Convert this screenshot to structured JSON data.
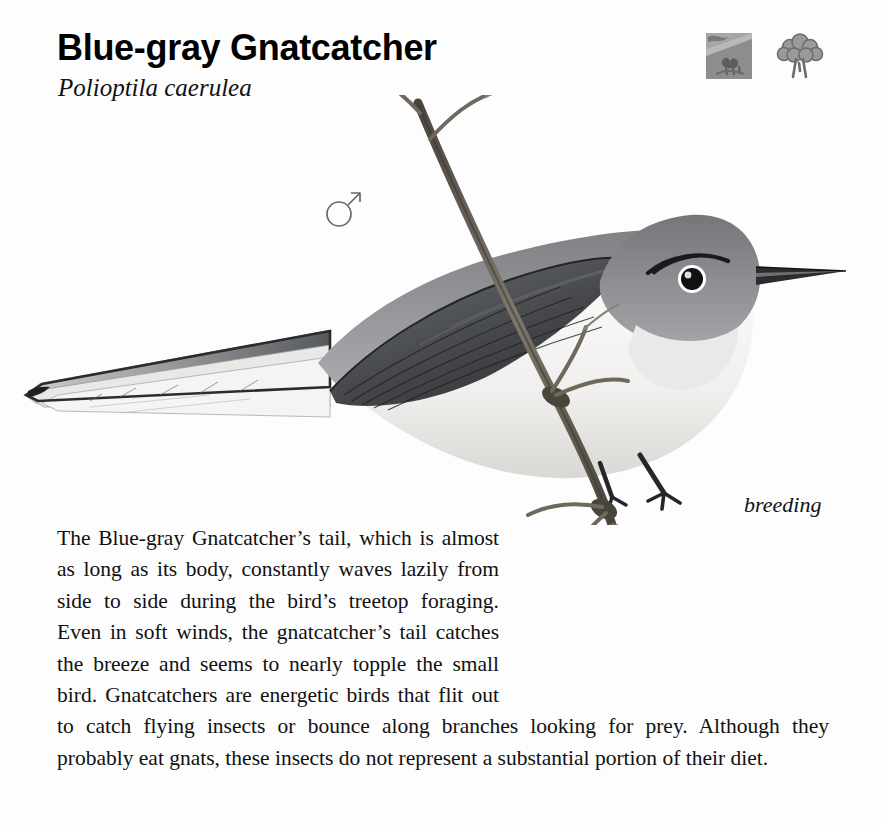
{
  "page": {
    "background": "#fdfdfd",
    "ink": "#111111"
  },
  "header": {
    "common_name": "Blue-gray Gnatcatcher",
    "scientific_name": "Polioptila caerulea"
  },
  "habitat_icons": [
    {
      "name": "hillside-scrub-habitat-icon",
      "label": "hillside scrub habitat",
      "color": "#8f8f8f"
    },
    {
      "name": "deciduous-tree-habitat-icon",
      "label": "deciduous woodland habitat",
      "color": "#909090"
    }
  ],
  "illustration": {
    "alt": "Blue-gray Gnatcatcher perched on a thin branch, long white-edged tail trailing left",
    "sex_symbol": "♂",
    "sex_label": "male",
    "plumage_caption": "breeding",
    "palette": {
      "crown": "#8b8d90",
      "back": "#9a9c9f",
      "wing": "#4a4c50",
      "underparts": "#f2f2f0",
      "tail_dark": "#3f4145",
      "branch": "#6f6a60",
      "eye": "#141414",
      "eyering": "#ffffff"
    }
  },
  "description": {
    "paragraph": "The Blue-gray Gnatcatcher’s tail, which is almost as long as its body, constantly waves lazily from side to side during the bird’s treetop foraging. Even in soft winds, the gnatcatcher’s tail catches the breeze and seems to nearly topple the small bird. Gnatcatchers are energetic birds that flit out to catch flying insects or bounce along branches looking for prey. Although they probably eat gnats, these insects do not represent a substantial portion of their diet."
  }
}
